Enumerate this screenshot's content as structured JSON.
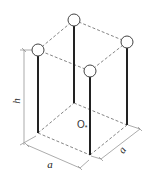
{
  "diagram": {
    "title": "",
    "labels": {
      "height": "h",
      "width_left": "a",
      "width_right": "a",
      "center": "O",
      "center_sub": "*"
    },
    "colors": {
      "post": "#222222",
      "dashed": "#777777",
      "dimension": "#888888",
      "node_fill": "#ffffff",
      "node_stroke": "#444444"
    },
    "nodes": [
      {
        "id": "top-back",
        "x": 74,
        "y": 20
      },
      {
        "id": "top-right",
        "x": 127,
        "y": 42
      },
      {
        "id": "top-left",
        "x": 38,
        "y": 50
      },
      {
        "id": "top-front",
        "x": 90,
        "y": 71
      }
    ]
  }
}
